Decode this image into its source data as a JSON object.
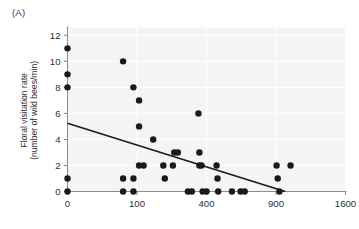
{
  "panel": {
    "label": "(A)"
  },
  "axis_titles": {
    "y_line1": "Floral visitation rate",
    "y_line2": "(number of wild bees/min)",
    "x": ""
  },
  "chart_data": {
    "type": "scatter",
    "title": "",
    "subtitle": "",
    "xlabel": "",
    "ylabel": "Floral visitation rate (number of wild bees/min)",
    "x_scale": "sqrt",
    "y_scale": "linear",
    "xlim": [
      0,
      1600
    ],
    "ylim": [
      0,
      12.6
    ],
    "xticks": [
      0,
      100,
      400,
      900,
      1600
    ],
    "xticklabels": [
      "0",
      "100",
      "400",
      "900",
      "1600"
    ],
    "yticks": [
      0,
      2,
      4,
      6,
      8,
      10,
      12
    ],
    "yticklabels": [
      "0",
      "2",
      "4",
      "6",
      "8",
      "10",
      "12"
    ],
    "grid": true,
    "grid_color": "#ffffff",
    "plot_bgcolor": "#f4f4f4",
    "legend": null,
    "legend_position": "none",
    "marker_color": "#1a1a1a",
    "marker_size": 4.2,
    "series": [
      {
        "name": "Wild bee floral visitation",
        "points": [
          [
            0,
            11
          ],
          [
            0,
            9
          ],
          [
            0,
            8
          ],
          [
            0,
            1
          ],
          [
            0,
            0
          ],
          [
            64,
            10
          ],
          [
            64,
            1
          ],
          [
            64,
            0
          ],
          [
            90,
            8
          ],
          [
            90,
            1
          ],
          [
            90,
            0
          ],
          [
            106,
            7
          ],
          [
            106,
            5
          ],
          [
            106,
            2
          ],
          [
            120,
            2
          ],
          [
            152,
            4
          ],
          [
            190,
            2
          ],
          [
            196,
            1
          ],
          [
            230,
            2
          ],
          [
            236,
            3
          ],
          [
            252,
            3
          ],
          [
            300,
            0
          ],
          [
            320,
            0
          ],
          [
            355,
            6
          ],
          [
            360,
            3
          ],
          [
            360,
            2
          ],
          [
            372,
            2
          ],
          [
            378,
            0
          ],
          [
            400,
            0
          ],
          [
            460,
            2
          ],
          [
            466,
            1
          ],
          [
            470,
            0
          ],
          [
            560,
            0
          ],
          [
            620,
            0
          ],
          [
            650,
            0
          ],
          [
            905,
            2
          ],
          [
            915,
            1
          ],
          [
            930,
            0
          ],
          [
            1030,
            2
          ]
        ]
      }
    ],
    "trendline": {
      "name": "linear fit (on sqrt-x)",
      "color": "#1a1a1a",
      "width": 1.6,
      "x_start": 0,
      "y_start": 5.25,
      "x_end": 980,
      "y_end": 0.0
    }
  }
}
